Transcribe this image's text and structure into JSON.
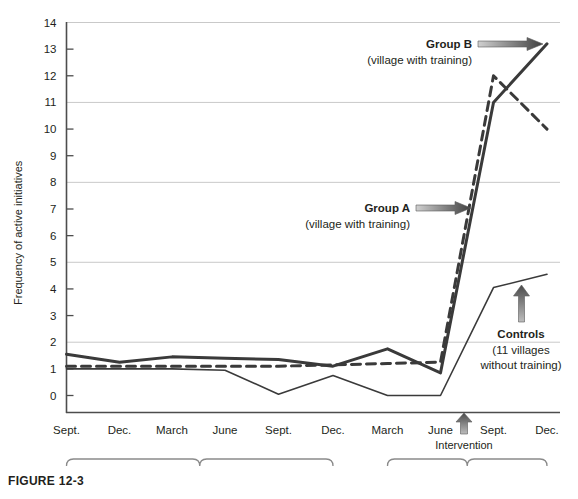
{
  "figure": {
    "caption": "FIGURE 12-3"
  },
  "chart_data": {
    "type": "line",
    "title": "",
    "xlabel": "",
    "ylabel": "Frequency of active initiatives",
    "ylim": [
      0,
      14
    ],
    "yticks": [
      0,
      1,
      2,
      3,
      4,
      5,
      6,
      7,
      8,
      9,
      10,
      11,
      12,
      13,
      14
    ],
    "gridlines": [
      2,
      5,
      8,
      11,
      14
    ],
    "grid": true,
    "legend_position": "inline-annotations",
    "categories": [
      "Sept.",
      "Dec.",
      "March",
      "June",
      "Sept.",
      "Dec.",
      "March",
      "June",
      "Sept.",
      "Dec."
    ],
    "period_groups": [
      {
        "label": "1976",
        "from_index": 0,
        "to_index": 5
      },
      {
        "label": "1977",
        "from_index": 6,
        "to_index": 9
      }
    ],
    "series": [
      {
        "name": "Group B",
        "sublabel": "(village with training)",
        "style": "solid-thick",
        "color": "#3a3a3a",
        "values": [
          1.55,
          1.25,
          1.45,
          1.4,
          1.35,
          1.1,
          1.75,
          0.85,
          11.0,
          13.2
        ]
      },
      {
        "name": "Group A",
        "sublabel": "(village with training)",
        "style": "dashed",
        "color": "#3a3a3a",
        "values": [
          1.1,
          1.1,
          1.1,
          1.1,
          1.1,
          1.15,
          1.2,
          1.25,
          12.0,
          10.0
        ]
      },
      {
        "name": "Controls",
        "sublabel": "(11 villages without training)",
        "style": "solid-thin",
        "color": "#3a3a3a",
        "values": [
          1.0,
          1.0,
          1.0,
          0.95,
          0.05,
          0.75,
          0.0,
          0.0,
          4.05,
          4.55
        ]
      }
    ],
    "annotations": [
      {
        "id": "group-b",
        "bold": "Group B",
        "regular": "(village with training)"
      },
      {
        "id": "group-a",
        "bold": "Group A",
        "regular": "(village with training)"
      },
      {
        "id": "controls",
        "bold": "Controls",
        "line1": "(11 villages",
        "line2": "without training)"
      },
      {
        "id": "intervention",
        "text": "Intervention"
      }
    ]
  },
  "colors": {
    "ink": "#231f20",
    "line": "#3a3a3a",
    "grid": "#c9c9c9",
    "axis": "#4d4d4d"
  }
}
